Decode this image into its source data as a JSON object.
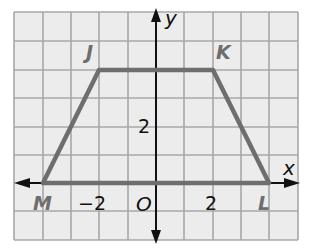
{
  "figure": {
    "type": "coordinate-plane-trapezoid",
    "grid": {
      "cell_px": 28.4,
      "x_range": [
        -5,
        5
      ],
      "y_range": [
        -2,
        6
      ]
    },
    "axes": {
      "x_label": "x",
      "y_label": "y",
      "origin_label": "O"
    },
    "tick_labels": {
      "x_neg2": "−2",
      "x_pos2": "2",
      "y_pos2": "2"
    },
    "vertices": [
      {
        "name": "J",
        "x": -2,
        "y": 4
      },
      {
        "name": "K",
        "x": 2,
        "y": 4
      },
      {
        "name": "L",
        "x": 4,
        "y": 0
      },
      {
        "name": "M",
        "x": -4,
        "y": 0
      }
    ],
    "colors": {
      "grid_bg": "#ececec",
      "grid_line": "#a8a8a8",
      "shape": "#6e6e6e",
      "axis": "#111111",
      "label": "#6e6e6e"
    }
  }
}
